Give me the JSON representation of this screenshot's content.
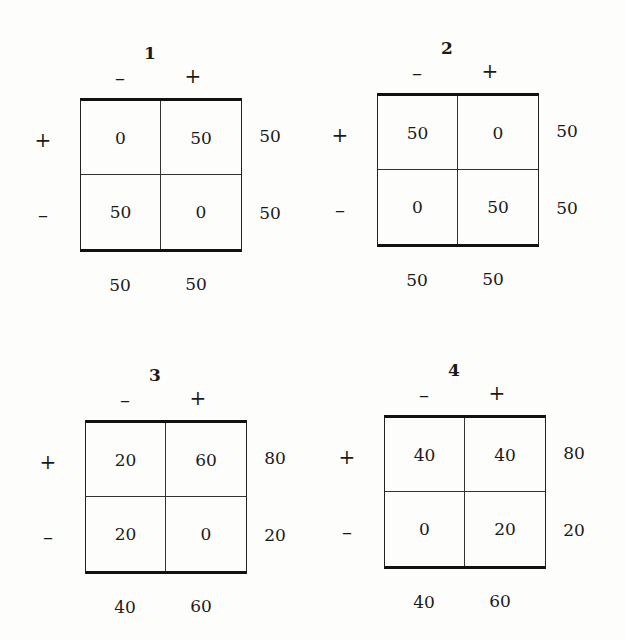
{
  "panels": [
    {
      "title": "1",
      "col_labels": [
        "–",
        "+"
      ],
      "row_labels": [
        "+",
        "–"
      ],
      "cells": [
        [
          "0",
          "50"
        ],
        [
          "50",
          "0"
        ]
      ],
      "row_totals": [
        "50",
        "50"
      ],
      "col_totals": [
        "50",
        "50"
      ],
      "pos": {
        "left": 0,
        "top": 0
      }
    },
    {
      "title": "2",
      "col_labels": [
        "–",
        "+"
      ],
      "row_labels": [
        "+",
        "–"
      ],
      "cells": [
        [
          "50",
          "0"
        ],
        [
          "0",
          "50"
        ]
      ],
      "row_totals": [
        "50",
        "50"
      ],
      "col_totals": [
        "50",
        "50"
      ],
      "pos": {
        "left": 297,
        "top": -5
      }
    },
    {
      "title": "3",
      "col_labels": [
        "–",
        "+"
      ],
      "row_labels": [
        "+",
        "–"
      ],
      "cells": [
        [
          "20",
          "60"
        ],
        [
          "20",
          "0"
        ]
      ],
      "row_totals": [
        "80",
        "20"
      ],
      "col_totals": [
        "40",
        "60"
      ],
      "pos": {
        "left": 5,
        "top": 322
      }
    },
    {
      "title": "4",
      "col_labels": [
        "–",
        "+"
      ],
      "row_labels": [
        "+",
        "–"
      ],
      "cells": [
        [
          "40",
          "40"
        ],
        [
          "0",
          "20"
        ]
      ],
      "row_totals": [
        "80",
        "20"
      ],
      "col_totals": [
        "40",
        "60"
      ],
      "pos": {
        "left": 304,
        "top": 317
      }
    }
  ]
}
